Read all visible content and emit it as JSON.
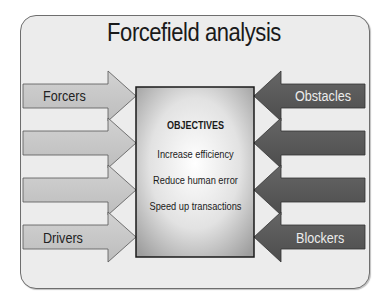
{
  "title": "Forcefield analysis",
  "objectives": {
    "heading": "OBJECTIVES",
    "items": [
      "Increase efficiency",
      "Reduce human error",
      "Speed up transactions"
    ]
  },
  "left_arrows": {
    "labels": [
      "Forcers",
      "",
      "",
      "Drivers"
    ],
    "fill_color": "#c8c8c8"
  },
  "right_arrows": {
    "labels": [
      "Obstacles",
      "",
      "",
      "Blockers"
    ],
    "fill_color": "#5a5a5a"
  },
  "colors": {
    "card_bg": "#ececec",
    "objective_box_gradient_center": "#ffffff",
    "objective_box_gradient_edge": "#a9a9a9"
  }
}
